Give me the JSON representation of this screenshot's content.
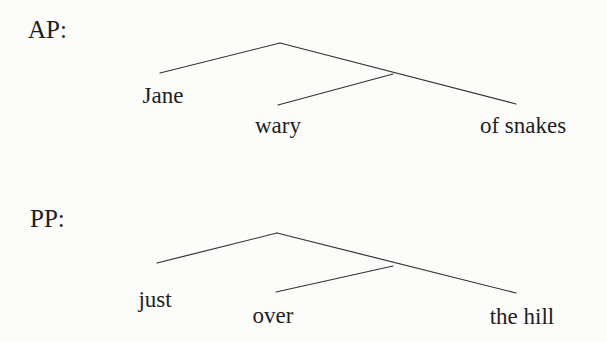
{
  "diagram": {
    "trees": [
      {
        "label": "AP:",
        "leaves": {
          "left": "Jane",
          "mid": "wary",
          "right": "of snakes"
        }
      },
      {
        "label": "PP:",
        "leaves": {
          "left": "just",
          "mid": "over",
          "right": "the hill"
        }
      }
    ]
  },
  "colors": {
    "background": "#fcfcfb",
    "line": "#333333",
    "text": "#1e1e1e"
  }
}
